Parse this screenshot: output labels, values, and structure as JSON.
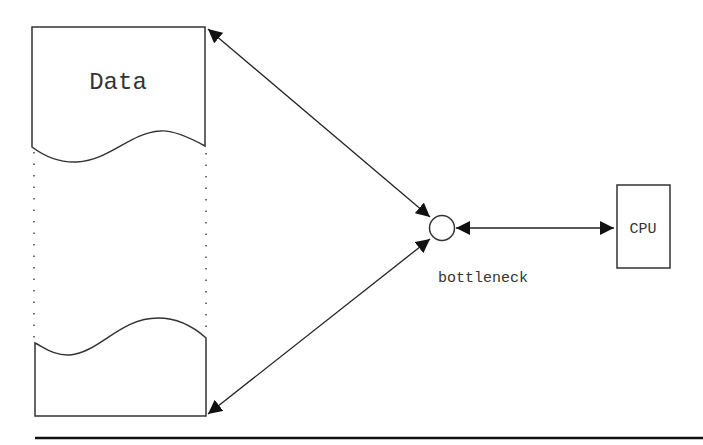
{
  "diagram": {
    "data_label": "Data",
    "cpu_label": "CPU",
    "bottleneck_label": "bottleneck",
    "nodes": [
      {
        "id": "data",
        "label": "Data",
        "shape": "document-split"
      },
      {
        "id": "bottleneck",
        "label": "bottleneck",
        "shape": "circle"
      },
      {
        "id": "cpu",
        "label": "CPU",
        "shape": "rectangle"
      }
    ],
    "edges": [
      {
        "from": "data-top",
        "to": "bottleneck",
        "direction": "both"
      },
      {
        "from": "data-bottom",
        "to": "bottleneck",
        "direction": "both"
      },
      {
        "from": "bottleneck",
        "to": "cpu",
        "direction": "both"
      }
    ],
    "colors": {
      "stroke": "#222222",
      "text": "#333333",
      "background": "#ffffff"
    }
  }
}
